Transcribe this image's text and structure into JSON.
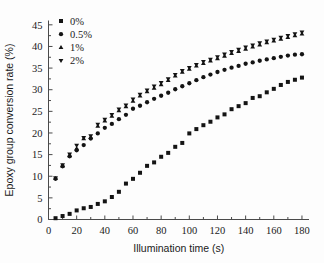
{
  "chart_data": {
    "type": "scatter",
    "title": "",
    "xlabel": "Illumination time (s)",
    "ylabel": "Epoxy group conversion rate (%)",
    "xlim": [
      0,
      185
    ],
    "ylim": [
      0,
      46
    ],
    "xticks": [
      0,
      20,
      40,
      60,
      80,
      100,
      120,
      140,
      160,
      180
    ],
    "yticks": [
      0,
      5,
      10,
      15,
      20,
      25,
      30,
      35,
      40,
      45
    ],
    "grid": false,
    "legend_position": "top-left",
    "x": [
      5,
      10,
      15,
      20,
      25,
      30,
      35,
      40,
      45,
      50,
      55,
      60,
      65,
      70,
      75,
      80,
      85,
      90,
      95,
      100,
      105,
      110,
      115,
      120,
      125,
      130,
      135,
      140,
      145,
      150,
      155,
      160,
      165,
      170,
      175,
      180
    ],
    "series": [
      {
        "name": "0%",
        "marker": "square",
        "values": [
          0.3,
          0.8,
          1.3,
          2.1,
          2.6,
          2.9,
          3.6,
          4.2,
          5.2,
          6.4,
          8.3,
          9.4,
          10.8,
          12.4,
          13.2,
          14.5,
          15.4,
          16.8,
          17.7,
          19.9,
          20.9,
          21.8,
          22.6,
          23.6,
          24.3,
          25.5,
          26.2,
          26.9,
          28.1,
          28.5,
          29.4,
          30.2,
          31.1,
          31.8,
          32.3,
          32.8
        ]
      },
      {
        "name": "0.5%",
        "marker": "circle",
        "values": [
          9.4,
          12.3,
          14.6,
          16.0,
          17.2,
          18.7,
          19.9,
          21.2,
          22.1,
          23.2,
          24.2,
          25.6,
          26.3,
          27.1,
          27.9,
          28.6,
          29.3,
          30.1,
          30.8,
          31.5,
          32.2,
          32.9,
          33.5,
          34.1,
          34.6,
          35.1,
          35.5,
          36.0,
          36.3,
          36.7,
          37.0,
          37.3,
          37.6,
          37.9,
          38.1,
          38.2
        ]
      },
      {
        "name": "1%",
        "marker": "triangle-up",
        "values": [
          9.5,
          12.4,
          14.8,
          16.4,
          18.7,
          19.0,
          21.6,
          22.8,
          23.9,
          25.2,
          26.1,
          27.4,
          28.6,
          29.6,
          30.4,
          31.2,
          32.2,
          33.2,
          34.1,
          34.8,
          35.5,
          36.1,
          36.7,
          37.2,
          37.8,
          38.4,
          38.9,
          39.4,
          39.9,
          40.4,
          40.9,
          41.3,
          41.7,
          42.1,
          42.5,
          42.9
        ]
      },
      {
        "name": "2%",
        "marker": "triangle-down",
        "values": [
          9.6,
          12.6,
          15.1,
          17.1,
          18.9,
          19.3,
          22.0,
          23.1,
          24.2,
          25.5,
          26.4,
          27.8,
          28.9,
          29.9,
          30.8,
          31.6,
          32.5,
          33.5,
          34.4,
          35.1,
          35.8,
          36.5,
          37.0,
          37.6,
          38.2,
          38.8,
          39.3,
          39.8,
          40.3,
          40.8,
          41.2,
          41.6,
          42.1,
          42.5,
          42.9,
          43.3
        ]
      }
    ]
  },
  "legend": {
    "entries": [
      {
        "label": "0%",
        "marker": "square"
      },
      {
        "label": "0.5%",
        "marker": "circle"
      },
      {
        "label": "1%",
        "marker": "triangle-up"
      },
      {
        "label": "2%",
        "marker": "triangle-down"
      }
    ]
  },
  "colors": {
    "marker": "#141414",
    "axis": "#4a4a4a",
    "background": "#fdfdfd"
  }
}
